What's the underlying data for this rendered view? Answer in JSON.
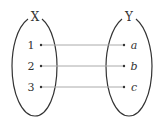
{
  "diagram": {
    "type": "mapping",
    "sets": [
      {
        "name": "X",
        "elements": [
          "1",
          "2",
          "3"
        ]
      },
      {
        "name": "Y",
        "elements": [
          "a",
          "b",
          "c"
        ]
      }
    ],
    "mappings": [
      {
        "from": "1",
        "to": "a"
      },
      {
        "from": "2",
        "to": "b"
      },
      {
        "from": "3",
        "to": "c"
      }
    ],
    "colors": {
      "ellipse": "#333333",
      "arrow_line": "#aaaaaa",
      "text": "#333333"
    }
  }
}
